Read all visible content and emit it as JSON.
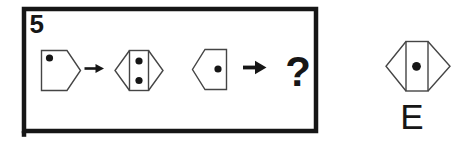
{
  "puzzle": {
    "number": "5",
    "question_mark": "?",
    "sequence": [
      {
        "item": "pentagon-right",
        "dots": 1
      },
      {
        "item": "arrow-right",
        "dots": 0
      },
      {
        "item": "hexagon",
        "dots": 2
      },
      {
        "item": "pentagon-left",
        "dots": 1
      },
      {
        "item": "arrow-right",
        "dots": 0
      },
      {
        "item": "question-mark",
        "dots": 0
      }
    ]
  },
  "answer_option": {
    "label": "E",
    "shape": "hexagon",
    "dots": 1
  },
  "colors": {
    "ink": "#161616",
    "outline": "#454545",
    "background": "#ffffff"
  }
}
